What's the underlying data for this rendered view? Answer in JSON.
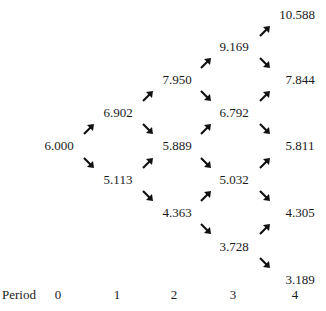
{
  "period_label": "Period",
  "periods": [
    "0",
    "1",
    "2",
    "3",
    "4"
  ],
  "nodes": [
    {
      "value": "6.000",
      "period": 0
    },
    {
      "value": "6.902",
      "period": 1
    },
    {
      "value": "5.113",
      "period": 1
    },
    {
      "value": "7.950",
      "period": 2
    },
    {
      "value": "5.889",
      "period": 2
    },
    {
      "value": "4.363",
      "period": 2
    },
    {
      "value": "9.169",
      "period": 3
    },
    {
      "value": "6.792",
      "period": 3
    },
    {
      "value": "5.032",
      "period": 3
    },
    {
      "value": "3.728",
      "period": 3
    },
    {
      "value": "10.588",
      "period": 4
    },
    {
      "value": "7.844",
      "period": 4
    },
    {
      "value": "5.811",
      "period": 4
    },
    {
      "value": "4.305",
      "period": 4
    },
    {
      "value": "3.189",
      "period": 4
    }
  ],
  "arrow_color": "#111111"
}
